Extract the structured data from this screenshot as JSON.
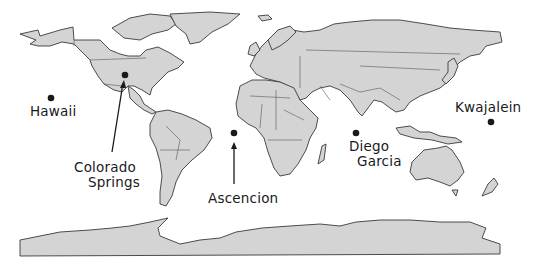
{
  "map": {
    "type": "world-map",
    "colors": {
      "land": "#d4d4d4",
      "outline": "#3a3a3a",
      "marker": "#1a1a1a",
      "background": "#ffffff"
    },
    "locations": [
      {
        "id": "hawaii",
        "label": "Hawaii",
        "marker": [
          51,
          98
        ]
      },
      {
        "id": "colorado-springs",
        "label_line1": "Colorado",
        "label_line2": "Springs",
        "marker": [
          125,
          75
        ]
      },
      {
        "id": "ascencion",
        "label": "Ascencion",
        "marker": [
          234,
          133
        ]
      },
      {
        "id": "diego-garcia",
        "label_line1": "Diego",
        "label_line2": "Garcia",
        "marker": [
          356,
          133
        ]
      },
      {
        "id": "kwajalein",
        "label": "Kwajalein",
        "marker": [
          491,
          122
        ]
      }
    ]
  }
}
